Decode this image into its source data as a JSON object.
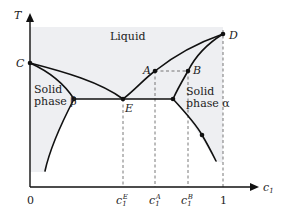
{
  "diagram": {
    "type": "binary eutectic phase diagram",
    "axes": {
      "y_label": "T",
      "x_label": "c",
      "x_label_sub": "1",
      "x_ticks": [
        {
          "label": "0",
          "sup": "",
          "sub": ""
        },
        {
          "label": "c",
          "sup": "E",
          "sub": "1"
        },
        {
          "label": "c",
          "sup": "A",
          "sub": "1"
        },
        {
          "label": "c",
          "sup": "B",
          "sub": "1"
        },
        {
          "label": "1",
          "sup": "",
          "sub": ""
        }
      ]
    },
    "regions": {
      "liquid": "Liquid",
      "solid_beta_line1": "Solid",
      "solid_beta_line2": "phase β",
      "solid_alpha_line1": "Solid",
      "solid_alpha_line2": "phase α"
    },
    "points": {
      "C": "C",
      "D": "D",
      "E": "E",
      "A": "A",
      "B": "B"
    },
    "colors": {
      "shade": "#eeeff2",
      "line": "#111111",
      "dashed": "#555555"
    }
  }
}
